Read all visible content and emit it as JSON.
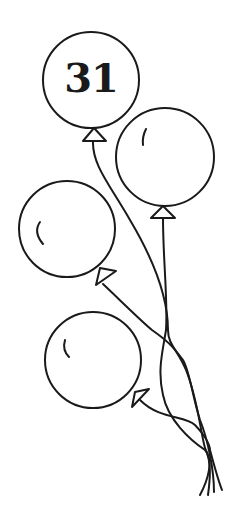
{
  "illustration": {
    "subject": "bunch of four balloons tied with strings",
    "balloon_label": "31",
    "line_color": "#1a1a1a",
    "background_color": "#ffffff",
    "balloons": [
      {
        "name": "top-balloon",
        "cx": 91,
        "cy": 80,
        "r": 48,
        "label": "31"
      },
      {
        "name": "right-balloon",
        "cx": 165,
        "cy": 157,
        "r": 49
      },
      {
        "name": "left-balloon",
        "cx": 67,
        "cy": 229,
        "r": 48
      },
      {
        "name": "bottom-balloon",
        "cx": 93,
        "cy": 360,
        "r": 48
      }
    ]
  }
}
